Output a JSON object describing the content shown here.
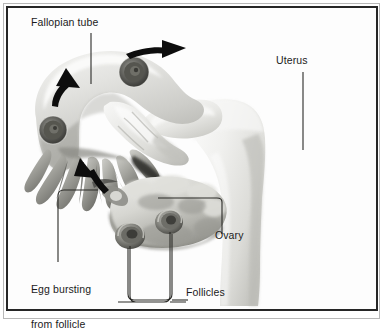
{
  "figure": {
    "title_alt": "Ovulation: fallopian tube, ovary and follicles",
    "background_color": "#ffffff",
    "frame_color": "#262626",
    "frame_outer_color": "#b8b8b8",
    "label_color": "#1b1b1b",
    "arrow_color": "#0d0d0d"
  },
  "labels": {
    "fallopian_tube": "Fallopian tube",
    "uterus": "Uterus",
    "ovary": "Ovary",
    "follicles": "Follicles",
    "egg_bursting_line1": "Egg bursting",
    "egg_bursting_line2": "from follicle"
  },
  "anatomy": {
    "parts": [
      "fallopian-tube-ampulla",
      "fimbriae",
      "uterus-body",
      "ovary",
      "follicle-spiral-left",
      "follicle-spiral-right",
      "tube-cross-section-upper",
      "tube-cross-section-lower",
      "egg"
    ]
  },
  "arrows": {
    "items": [
      {
        "name": "arrow-tube-transport-right",
        "direction": "right"
      },
      {
        "name": "arrow-tube-transport-up",
        "direction": "up-right"
      },
      {
        "name": "arrow-egg-pickup",
        "direction": "up-left"
      }
    ]
  },
  "leaders": {
    "items": [
      {
        "name": "leader-fallopian-tube",
        "style": "straight-vertical"
      },
      {
        "name": "leader-uterus",
        "style": "straight-vertical"
      },
      {
        "name": "leader-ovary",
        "style": "elbow"
      },
      {
        "name": "leader-follicles",
        "style": "bracket"
      },
      {
        "name": "leader-egg-bursting",
        "style": "elbow"
      }
    ]
  }
}
